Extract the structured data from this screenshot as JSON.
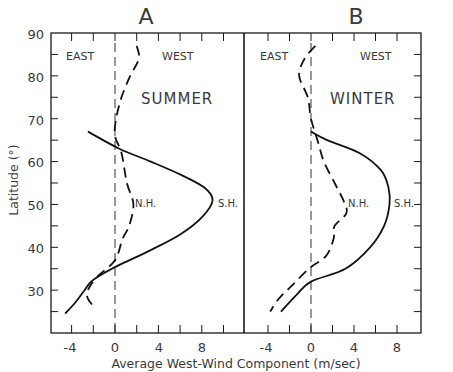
{
  "chart_data": [
    {
      "type": "line",
      "panel": "A",
      "title": "A",
      "annotation": "SUMMER",
      "region_labels": [
        "EAST",
        "WEST"
      ],
      "xlabel": "Average West-Wind Component (m/sec)",
      "ylabel": "Latitude (°)",
      "xlim": [
        -6,
        12
      ],
      "ylim": [
        20,
        90
      ],
      "xticks": [
        -4,
        0,
        4,
        8
      ],
      "yticks": [
        30,
        40,
        50,
        60,
        70,
        80,
        90
      ],
      "zero_line": "dashed vertical at x=0",
      "series": [
        {
          "name": "N.H.",
          "style": "dashed",
          "points": [
            [
              2.0,
              87
            ],
            [
              2.2,
              84
            ],
            [
              1.4,
              80
            ],
            [
              0.6,
              75
            ],
            [
              0.1,
              70
            ],
            [
              0.0,
              66
            ],
            [
              0.6,
              62
            ],
            [
              1.1,
              55
            ],
            [
              1.7,
              50
            ],
            [
              1.3,
              45
            ],
            [
              0.7,
              42
            ],
            [
              0.0,
              37
            ],
            [
              -1.7,
              33
            ],
            [
              -2.5,
              30
            ],
            [
              -2.5,
              28
            ],
            [
              -1.9,
              26
            ]
          ]
        },
        {
          "name": "S.H.",
          "style": "solid",
          "points": [
            [
              -2.5,
              67
            ],
            [
              0.4,
              63
            ],
            [
              3.3,
              60
            ],
            [
              6.0,
              57
            ],
            [
              8.2,
              54
            ],
            [
              9.0,
              51
            ],
            [
              8.0,
              47
            ],
            [
              6.0,
              43
            ],
            [
              3.0,
              39
            ],
            [
              0.5,
              36
            ],
            [
              -1.0,
              34
            ],
            [
              -2.2,
              32
            ],
            [
              -2.8,
              30
            ],
            [
              -3.7,
              27
            ],
            [
              -4.6,
              24.5
            ]
          ]
        }
      ]
    },
    {
      "type": "line",
      "panel": "B",
      "title": "B",
      "annotation": "WINTER",
      "region_labels": [
        "EAST",
        "WEST"
      ],
      "xlabel": "Average West-Wind Component (m/sec)",
      "ylabel": "Latitude (°)",
      "xlim": [
        -6,
        10
      ],
      "ylim": [
        20,
        90
      ],
      "xticks": [
        -4,
        0,
        4,
        8
      ],
      "yticks": [
        30,
        40,
        50,
        60,
        70,
        80,
        90
      ],
      "zero_line": "dashed vertical at x=0",
      "series": [
        {
          "name": "N.H.",
          "style": "dashed",
          "points": [
            [
              0.4,
              87
            ],
            [
              -0.6,
              84
            ],
            [
              -1.1,
              80
            ],
            [
              -0.3,
              75
            ],
            [
              0.0,
              70
            ],
            [
              0.6,
              65
            ],
            [
              1.2,
              60
            ],
            [
              2.2,
              55
            ],
            [
              3.0,
              51
            ],
            [
              3.3,
              48
            ],
            [
              2.2,
              45
            ],
            [
              2.1,
              42
            ],
            [
              1.4,
              38
            ],
            [
              -0.2,
              35
            ],
            [
              -1.8,
              31
            ],
            [
              -3.0,
              28
            ],
            [
              -3.8,
              25
            ]
          ]
        },
        {
          "name": "S.H.",
          "style": "solid",
          "points": [
            [
              0.0,
              67
            ],
            [
              1.5,
              65
            ],
            [
              4.5,
              62
            ],
            [
              6.5,
              58
            ],
            [
              7.2,
              54
            ],
            [
              7.3,
              50
            ],
            [
              6.8,
              45
            ],
            [
              5.5,
              40
            ],
            [
              3.2,
              35
            ],
            [
              0.0,
              32
            ],
            [
              -1.3,
              29
            ],
            [
              -2.8,
              25
            ]
          ]
        }
      ]
    }
  ],
  "labels": {
    "panel_a": "A",
    "panel_b": "B",
    "season_a": "SUMMER",
    "season_b": "WINTER",
    "east": "EAST",
    "west": "WEST",
    "nh": "N.H.",
    "sh": "S.H.",
    "xlabel": "Average West-Wind Component (m/sec)",
    "ylabel": "Latitude (°)",
    "y_ticks": [
      "90",
      "80",
      "70",
      "60",
      "50",
      "40",
      "30"
    ],
    "x_ticks": [
      "-4",
      "0",
      "4",
      "8"
    ]
  }
}
